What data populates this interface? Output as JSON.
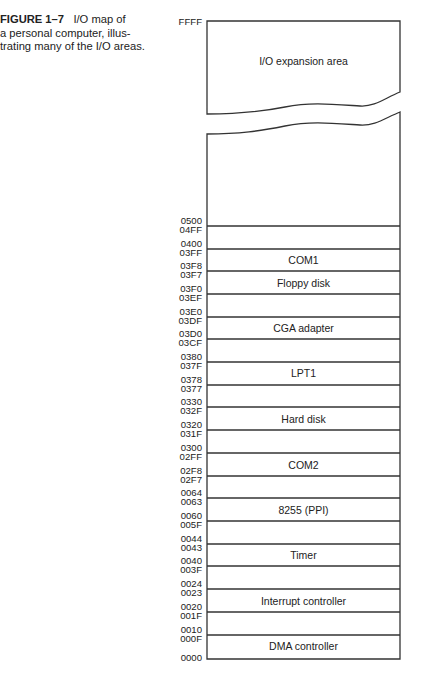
{
  "caption": {
    "figure_label": "FIGURE 1–7",
    "text": "I/O map of a personal computer, illustrating many of the I/O areas.",
    "lines": [
      "I/O map of",
      "a personal computer, illus-",
      "trating many of the I/O areas."
    ]
  },
  "diagram": {
    "top_address": "FFFF",
    "bottom_address": "0000",
    "expansion_label": "I/O expansion area",
    "boundaries": [
      {
        "upper": "0500",
        "lower": "04FF"
      },
      {
        "upper": "0400",
        "lower": "03FF"
      },
      {
        "upper": "03F8",
        "lower": "03F7"
      },
      {
        "upper": "03F0",
        "lower": "03EF"
      },
      {
        "upper": "03E0",
        "lower": "03DF"
      },
      {
        "upper": "03D0",
        "lower": "03CF"
      },
      {
        "upper": "0380",
        "lower": "037F"
      },
      {
        "upper": "0378",
        "lower": "0377"
      },
      {
        "upper": "0330",
        "lower": "032F"
      },
      {
        "upper": "0320",
        "lower": "031F"
      },
      {
        "upper": "0300",
        "lower": "02FF"
      },
      {
        "upper": "02F8",
        "lower": "02F7"
      },
      {
        "upper": "0064",
        "lower": "0063"
      },
      {
        "upper": "0060",
        "lower": "005F"
      },
      {
        "upper": "0044",
        "lower": "0043"
      },
      {
        "upper": "0040",
        "lower": "003F"
      },
      {
        "upper": "0024",
        "lower": "0023"
      },
      {
        "upper": "0020",
        "lower": "001F"
      },
      {
        "upper": "0010",
        "lower": "000F"
      }
    ],
    "regions": [
      {
        "label": "COM1",
        "range": "03F8-03FF"
      },
      {
        "label": "Floppy disk",
        "range": "03F0-03F7"
      },
      {
        "label": "CGA adapter",
        "range": "03D0-03DF"
      },
      {
        "label": "LPT1",
        "range": "0378-037F"
      },
      {
        "label": "Hard disk",
        "range": "0320-032F"
      },
      {
        "label": "COM2",
        "range": "02F8-02FF"
      },
      {
        "label": "8255 (PPI)",
        "range": "0060-0063"
      },
      {
        "label": "Timer",
        "range": "0040-0043"
      },
      {
        "label": "Interrupt controller",
        "range": "0020-0023"
      },
      {
        "label": "DMA controller",
        "range": "0000-000F"
      }
    ]
  }
}
